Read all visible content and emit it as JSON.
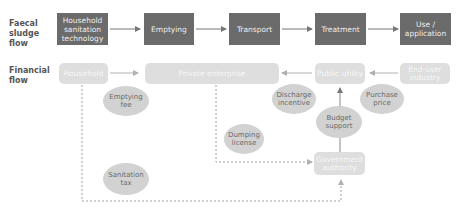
{
  "rows": {
    "faecal_sludge_label": "Faecal\nsludge\nflow",
    "financial_label": "Financial\nflow"
  },
  "sludge_flow": [
    {
      "label": "Household sanitation technology"
    },
    {
      "label": "Emptying"
    },
    {
      "label": "Transport"
    },
    {
      "label": "Treatment"
    },
    {
      "label": "Use / application"
    }
  ],
  "financial_nodes": {
    "household": "Household",
    "private_enterprise": "Private enterprise",
    "public_utility": "Public utility",
    "end_user_industry": "End-user industry",
    "government_authority": "Government authority"
  },
  "financial_flows": {
    "emptying_fee": "Emptying fee",
    "discharge_incentive": "Discharge incentive",
    "purchase_price": "Purchase price",
    "budget_support": "Budget support",
    "dumping_license": "Dumping license",
    "sanitation_tax": "Sanitation tax"
  },
  "colors": {
    "dark_box": "#6b6b6b",
    "light_box": "#dedede",
    "ellipse": "#d2d2d2",
    "arrow": "#8a8a8a"
  }
}
